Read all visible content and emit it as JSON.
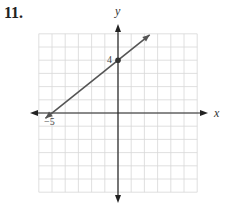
{
  "problem_number": "11.",
  "chart_data": {
    "type": "line",
    "title": "",
    "xlabel": "x",
    "ylabel": "y",
    "xlim": [
      -6,
      6
    ],
    "ylim": [
      -6,
      6
    ],
    "grid": true,
    "grid_step": 1,
    "series": [
      {
        "name": "line",
        "x": [
          -5,
          0
        ],
        "y": [
          0,
          4
        ],
        "arrows_both_ends": true
      }
    ],
    "points": [
      {
        "x": 0,
        "y": 4,
        "label": "4"
      }
    ],
    "annotations": [
      {
        "text": "4",
        "x": 0,
        "y": 4,
        "position": "left"
      },
      {
        "text": "−5",
        "x": -5,
        "y": 0,
        "position": "below"
      }
    ]
  }
}
